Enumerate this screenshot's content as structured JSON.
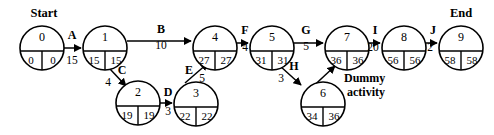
{
  "diagram": {
    "type": "activity-on-arrow-network",
    "start_label": "Start",
    "end_label": "End",
    "dummy_label_line1": "Dummy",
    "dummy_label_line2": "activity",
    "nodes": [
      {
        "id": "0",
        "early": "0",
        "late": "0",
        "cx": 42,
        "cy": 48,
        "r": 22
      },
      {
        "id": "1",
        "early": "15",
        "late": "15",
        "cx": 105,
        "cy": 48,
        "r": 22
      },
      {
        "id": "2",
        "early": "19",
        "late": "19",
        "cx": 138,
        "cy": 103,
        "r": 22
      },
      {
        "id": "3",
        "early": "22",
        "late": "22",
        "cx": 196,
        "cy": 104,
        "r": 22
      },
      {
        "id": "4",
        "early": "27",
        "late": "27",
        "cx": 215,
        "cy": 48,
        "r": 22
      },
      {
        "id": "5",
        "early": "31",
        "late": "31",
        "cx": 272,
        "cy": 48,
        "r": 22
      },
      {
        "id": "6",
        "early": "34",
        "late": "36",
        "cx": 323,
        "cy": 104,
        "r": 22
      },
      {
        "id": "7",
        "early": "36",
        "late": "36",
        "cx": 347,
        "cy": 48,
        "r": 22
      },
      {
        "id": "8",
        "early": "56",
        "late": "56",
        "cx": 404,
        "cy": 48,
        "r": 22
      },
      {
        "id": "9",
        "early": "58",
        "late": "58",
        "cx": 461,
        "cy": 48,
        "r": 22
      }
    ],
    "edges": [
      {
        "activity": "A",
        "duration": "15",
        "from": "0",
        "to": "1",
        "lx": 72,
        "ly": 36,
        "dx": 72,
        "dy": 61
      },
      {
        "activity": "B",
        "duration": "10",
        "from": "1",
        "to": "4",
        "lx": 161,
        "ly": 30,
        "dx": 161,
        "dy": 46
      },
      {
        "activity": "C",
        "duration": "4",
        "from": "1",
        "to": "2",
        "lx": 122,
        "ly": 71,
        "dx": 108,
        "dy": 83
      },
      {
        "activity": "D",
        "duration": "3",
        "from": "2",
        "to": "3",
        "lx": 168,
        "ly": 93,
        "dx": 168,
        "dy": 112
      },
      {
        "activity": "E",
        "duration": "5",
        "from": "3",
        "to": "4",
        "lx": 189,
        "ly": 71,
        "dx": 202,
        "dy": 79
      },
      {
        "activity": "F",
        "duration": "4",
        "from": "4",
        "to": "5",
        "lx": 245,
        "ly": 31,
        "dx": 245,
        "dy": 48
      },
      {
        "activity": "G",
        "duration": "5",
        "from": "5",
        "to": "7",
        "lx": 306,
        "ly": 31,
        "dx": 306,
        "dy": 47
      },
      {
        "activity": "H",
        "duration": "3",
        "from": "5",
        "to": "6",
        "lx": 294,
        "ly": 67,
        "dx": 281,
        "dy": 79
      },
      {
        "activity": "I",
        "duration": "20",
        "from": "7",
        "to": "8",
        "lx": 375,
        "ly": 31,
        "dx": 373,
        "dy": 48
      },
      {
        "activity": "J",
        "duration": "2",
        "from": "8",
        "to": "9",
        "lx": 433,
        "ly": 31,
        "dx": 430,
        "dy": 48
      }
    ],
    "dummy_edge": {
      "from": "6",
      "to": "7",
      "duration": "0"
    }
  }
}
